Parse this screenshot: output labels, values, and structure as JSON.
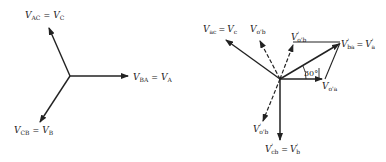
{
  "figure": {
    "left_diagram": {
      "name": "Original three-phase voltage phasors",
      "labels": {
        "vac": {
          "main": "V",
          "sub": "AC",
          "eq": "=",
          "rhs_main": "V",
          "rhs_sub": "C"
        },
        "vba": {
          "main": "V",
          "sub": "BA",
          "eq": "=",
          "rhs_main": "V",
          "rhs_sub": "A"
        },
        "vcb": {
          "main": "V",
          "sub": "CB",
          "eq": "=",
          "rhs_main": "V",
          "rhs_sub": "B"
        }
      }
    },
    "right_diagram": {
      "name": "Phase-shifted voltage phasors",
      "labels": {
        "vac": {
          "main": "V",
          "sub": "ac",
          "eq": "=",
          "rhs_main": "V",
          "rhs_sub": "c"
        },
        "vob": {
          "main": "V",
          "sub": "o'b"
        },
        "vob_prime": {
          "main": "V",
          "sub": "o'b",
          "prime": "'"
        },
        "vba_prime": {
          "main": "V",
          "sub": "ba",
          "prime": "'",
          "eq": "=",
          "rhs_main": "V",
          "rhs_sub": "a",
          "rhs_prime": "'"
        },
        "voa": {
          "main": "V",
          "sub": "o'a"
        },
        "vob_lower": {
          "main": "V",
          "sub": "o'b",
          "prime": "'"
        },
        "vcb_prime": {
          "main": "V",
          "sub": "cb",
          "prime": "'",
          "eq": "=",
          "rhs_main": "V",
          "rhs_sub": "b",
          "rhs_prime": "'"
        }
      },
      "angle_label": "30°"
    },
    "colors": {
      "ink": "#222222",
      "background": "#ffffff"
    }
  }
}
